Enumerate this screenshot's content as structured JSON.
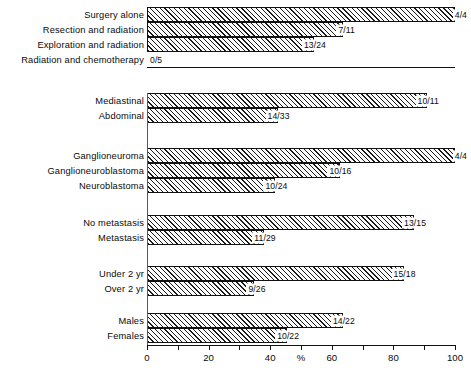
{
  "chart_data": {
    "type": "bar",
    "orientation": "horizontal",
    "title": "",
    "subtitle": "",
    "xlabel": "%",
    "ylabel": "",
    "xlim": [
      0,
      100
    ],
    "xticks": [
      0,
      10,
      20,
      30,
      40,
      50,
      60,
      70,
      80,
      90,
      100
    ],
    "xtick_labels": [
      "0",
      "20",
      "40",
      "60",
      "80",
      "100"
    ],
    "xtick_label_values": [
      0,
      20,
      40,
      60,
      80,
      100
    ],
    "grid": false,
    "legend": false,
    "axis_unit_symbol": "%",
    "axis_unit_position": 50,
    "bar_fill": "diagonal-hatch",
    "groups": [
      {
        "name": "treatment",
        "bars": [
          {
            "label": "Surgery alone",
            "value": 100.0,
            "annotation": "4/4",
            "numerator": 4,
            "denominator": 4
          },
          {
            "label": "Resection and radiation",
            "value": 63.6,
            "annotation": "7/11",
            "numerator": 7,
            "denominator": 11
          },
          {
            "label": "Exploration and radiation",
            "value": 54.2,
            "annotation": "13/24",
            "numerator": 13,
            "denominator": 24
          },
          {
            "label": "Radiation and chemotherapy",
            "value": 0.0,
            "annotation": "0/5",
            "numerator": 0,
            "denominator": 5
          }
        ]
      },
      {
        "name": "site",
        "bars": [
          {
            "label": "Mediastinal",
            "value": 90.9,
            "annotation": "10/11",
            "numerator": 10,
            "denominator": 11
          },
          {
            "label": "Abdominal",
            "value": 42.4,
            "annotation": "14/33",
            "numerator": 14,
            "denominator": 33
          }
        ]
      },
      {
        "name": "histology",
        "bars": [
          {
            "label": "Ganglioneuroma",
            "value": 100.0,
            "annotation": "4/4",
            "numerator": 4,
            "denominator": 4
          },
          {
            "label": "Ganglioneuroblastoma",
            "value": 62.5,
            "annotation": "10/16",
            "numerator": 10,
            "denominator": 16
          },
          {
            "label": "Neuroblastoma",
            "value": 41.7,
            "annotation": "10/24",
            "numerator": 10,
            "denominator": 24
          }
        ]
      },
      {
        "name": "metastasis",
        "bars": [
          {
            "label": "No metastasis",
            "value": 86.7,
            "annotation": "13/15",
            "numerator": 13,
            "denominator": 15
          },
          {
            "label": "Metastasis",
            "value": 37.9,
            "annotation": "11/29",
            "numerator": 11,
            "denominator": 29
          }
        ]
      },
      {
        "name": "age",
        "bars": [
          {
            "label": "Under 2 yr",
            "value": 83.3,
            "annotation": "15/18",
            "numerator": 15,
            "denominator": 18
          },
          {
            "label": "Over 2 yr",
            "value": 34.6,
            "annotation": "9/26",
            "numerator": 9,
            "denominator": 26
          }
        ]
      },
      {
        "name": "sex",
        "bars": [
          {
            "label": "Males",
            "value": 63.6,
            "annotation": "14/22",
            "numerator": 14,
            "denominator": 22
          },
          {
            "label": "Females",
            "value": 45.5,
            "annotation": "10/22",
            "numerator": 10,
            "denominator": 22
          }
        ]
      }
    ]
  }
}
